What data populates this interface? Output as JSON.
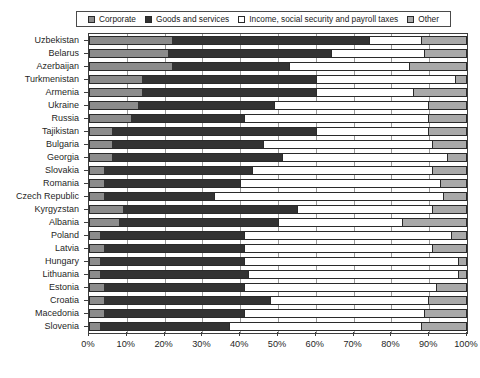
{
  "chart_data": {
    "type": "bar",
    "orientation": "horizontal",
    "stacked": true,
    "normalized_percent": true,
    "title": "",
    "subtitle": "",
    "xlabel": "",
    "ylabel": "",
    "xlim": [
      0,
      100
    ],
    "xtick_labels": [
      "0%",
      "10%",
      "20%",
      "30%",
      "40%",
      "50%",
      "60%",
      "70%",
      "80%",
      "90%",
      "100%"
    ],
    "xtick_values": [
      0,
      10,
      20,
      30,
      40,
      50,
      60,
      70,
      80,
      90,
      100
    ],
    "grid": true,
    "grid_axis": "x",
    "legend_position": "top",
    "categories": [
      "Uzbekistan",
      "Belarus",
      "Azerbaijan",
      "Turkmenistan",
      "Armenia",
      "Ukraine",
      "Russia",
      "Tajikistan",
      "Bulgaria",
      "Georgia",
      "Slovakia",
      "Romania",
      "Czech Republic",
      "Kyrgyzstan",
      "Albania",
      "Poland",
      "Latvia",
      "Hungary",
      "Lithuania",
      "Estonia",
      "Croatia",
      "Macedonia",
      "Slovenia"
    ],
    "series": [
      {
        "name": "Corporate",
        "color": "#8c8c8c",
        "values": [
          22,
          21,
          22,
          14,
          14,
          13,
          11,
          6,
          6,
          6,
          4,
          4,
          4,
          9,
          8,
          3,
          4,
          3,
          3,
          4,
          4,
          4,
          3
        ]
      },
      {
        "name": "Goods and services",
        "color": "#333333",
        "values": [
          52,
          43,
          31,
          46,
          46,
          36,
          30,
          54,
          40,
          45,
          39,
          36,
          29,
          46,
          42,
          38,
          37,
          38,
          39,
          37,
          44,
          37,
          34
        ]
      },
      {
        "name": "Income, social security and payroll taxes",
        "color": "#ffffff",
        "values": [
          14,
          25,
          32,
          37,
          26,
          41,
          49,
          30,
          45,
          44,
          48,
          53,
          61,
          36,
          33,
          55,
          50,
          57,
          56,
          51,
          42,
          48,
          51
        ]
      },
      {
        "name": "Other",
        "color": "#a9a9a9",
        "values": [
          12,
          11,
          15,
          3,
          14,
          10,
          10,
          10,
          9,
          5,
          9,
          7,
          6,
          9,
          17,
          4,
          9,
          2,
          2,
          8,
          10,
          11,
          12
        ]
      }
    ]
  },
  "legend": {
    "entries": [
      {
        "label": "Corporate",
        "swatch": "legend-swatch-corporate"
      },
      {
        "label": "Goods and services",
        "swatch": "legend-swatch-goods-and-services"
      },
      {
        "label": "Income, social security and payroll taxes",
        "swatch": "legend-swatch-income-social-security-payroll"
      },
      {
        "label": "Other",
        "swatch": "legend-swatch-other"
      }
    ]
  }
}
